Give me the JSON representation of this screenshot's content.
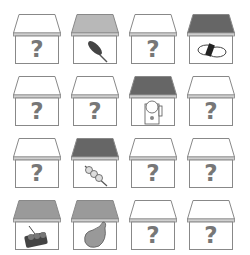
{
  "game": {
    "type": "memory-match-houses",
    "grid": {
      "rows": 4,
      "cols": 4
    },
    "colors": {
      "roof_hidden": "#ffffff",
      "roof_light": "#b8b8b8",
      "roof_medium": "#9a9a9a",
      "roof_dark": "#666666",
      "outline": "#888888",
      "question_mark": "#777777"
    },
    "houses": [
      {
        "row": 0,
        "col": 0,
        "state": "hidden",
        "roof": "roof_hidden",
        "label": "?",
        "item": ""
      },
      {
        "row": 0,
        "col": 1,
        "state": "revealed",
        "roof": "roof_light",
        "label": "",
        "item": "corn-dog"
      },
      {
        "row": 0,
        "col": 2,
        "state": "hidden",
        "roof": "roof_hidden",
        "label": "?",
        "item": ""
      },
      {
        "row": 0,
        "col": 3,
        "state": "revealed",
        "roof": "roof_dark",
        "label": "",
        "item": "sushi-roll"
      },
      {
        "row": 1,
        "col": 0,
        "state": "hidden",
        "roof": "roof_hidden",
        "label": "?",
        "item": ""
      },
      {
        "row": 1,
        "col": 1,
        "state": "hidden",
        "roof": "roof_hidden",
        "label": "?",
        "item": ""
      },
      {
        "row": 1,
        "col": 2,
        "state": "revealed",
        "roof": "roof_dark",
        "label": "",
        "item": "lucky-cat"
      },
      {
        "row": 1,
        "col": 3,
        "state": "hidden",
        "roof": "roof_hidden",
        "label": "?",
        "item": ""
      },
      {
        "row": 2,
        "col": 0,
        "state": "hidden",
        "roof": "roof_hidden",
        "label": "?",
        "item": ""
      },
      {
        "row": 2,
        "col": 1,
        "state": "revealed",
        "roof": "roof_dark",
        "label": "",
        "item": "dango-skewer"
      },
      {
        "row": 2,
        "col": 2,
        "state": "hidden",
        "roof": "roof_hidden",
        "label": "?",
        "item": ""
      },
      {
        "row": 2,
        "col": 3,
        "state": "hidden",
        "roof": "roof_hidden",
        "label": "?",
        "item": ""
      },
      {
        "row": 3,
        "col": 0,
        "state": "revealed",
        "roof": "roof_medium",
        "label": "",
        "item": "takoyaki-tray"
      },
      {
        "row": 3,
        "col": 1,
        "state": "revealed",
        "roof": "roof_medium",
        "label": "",
        "item": "pear-pouch"
      },
      {
        "row": 3,
        "col": 2,
        "state": "hidden",
        "roof": "roof_hidden",
        "label": "?",
        "item": ""
      },
      {
        "row": 3,
        "col": 3,
        "state": "hidden",
        "roof": "roof_hidden",
        "label": "?",
        "item": ""
      }
    ]
  }
}
